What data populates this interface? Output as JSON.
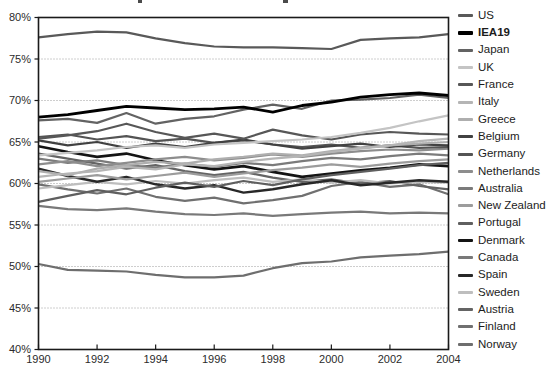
{
  "page": {
    "background": "#ffffff",
    "note": "line chart, y axis 40%-80%, x axis 1990-2004, legend of 20 country series on right, title cropped off at top edge"
  },
  "chart_data": {
    "type": "line",
    "x": [
      1990,
      1991,
      1992,
      1993,
      1994,
      1995,
      1996,
      1997,
      1998,
      1999,
      2000,
      2001,
      2002,
      2003,
      2004
    ],
    "x_tick_labels": [
      "1990",
      "1992",
      "1994",
      "1996",
      "1998",
      "2000",
      "2002",
      "2004"
    ],
    "y_tick_labels": [
      "40%",
      "45%",
      "50%",
      "55%",
      "60%",
      "65%",
      "70%",
      "75%",
      "80%"
    ],
    "xlim": [
      1990,
      2004
    ],
    "ylim": [
      40,
      80
    ],
    "grid": "horizontal dotted lines at 5% steps",
    "legend_position": "right",
    "axis_color": "#1a1a1a",
    "grid_color": "#9c9c9c",
    "tick_label_color": "#2b2b2b",
    "series": [
      {
        "name": "US",
        "color": "#595959",
        "width": 2.2,
        "legend_bold": false,
        "values": [
          77.6,
          78.0,
          78.3,
          78.2,
          77.5,
          76.9,
          76.5,
          76.4,
          76.4,
          76.3,
          76.2,
          77.3,
          77.5,
          77.6,
          78.0
        ]
      },
      {
        "name": "IEA19",
        "color": "#000000",
        "width": 2.8,
        "legend_bold": true,
        "values": [
          68.0,
          68.3,
          68.8,
          69.3,
          69.1,
          68.9,
          69.0,
          69.2,
          68.6,
          69.4,
          69.8,
          70.4,
          70.7,
          70.9,
          70.6
        ]
      },
      {
        "name": "Japan",
        "color": "#636363",
        "width": 2.2,
        "legend_bold": false,
        "values": [
          67.6,
          67.8,
          67.3,
          68.5,
          67.2,
          67.8,
          68.1,
          68.9,
          69.5,
          69.0,
          70.0,
          70.1,
          70.3,
          70.7,
          70.3
        ]
      },
      {
        "name": "UK",
        "color": "#c4c4c4",
        "width": 2.2,
        "legend_bold": false,
        "values": [
          63.4,
          63.7,
          64.0,
          64.4,
          64.6,
          64.3,
          64.7,
          64.9,
          65.1,
          65.3,
          65.6,
          66.1,
          66.7,
          67.5,
          68.2
        ]
      },
      {
        "name": "France",
        "color": "#575757",
        "width": 2.2,
        "legend_bold": false,
        "values": [
          65.4,
          65.8,
          66.3,
          67.2,
          66.2,
          65.5,
          66.0,
          65.4,
          66.5,
          65.8,
          65.3,
          65.9,
          66.2,
          66.0,
          65.9
        ]
      },
      {
        "name": "Italy",
        "color": "#b5b5b5",
        "width": 2.2,
        "legend_bold": false,
        "values": [
          60.8,
          61.2,
          61.5,
          62.0,
          61.7,
          62.3,
          62.1,
          62.6,
          63.0,
          63.3,
          63.8,
          64.2,
          64.6,
          65.1,
          65.4
        ]
      },
      {
        "name": "Greece",
        "color": "#aeaeae",
        "width": 2.2,
        "legend_bold": false,
        "values": [
          61.5,
          61.0,
          61.8,
          62.2,
          62.6,
          62.4,
          62.9,
          63.2,
          63.6,
          63.4,
          63.9,
          64.3,
          64.6,
          64.8,
          65.0
        ]
      },
      {
        "name": "Belgium",
        "color": "#414141",
        "width": 2.2,
        "legend_bold": false,
        "values": [
          65.2,
          64.6,
          65.0,
          64.3,
          64.8,
          64.4,
          64.9,
          65.3,
          64.7,
          64.2,
          64.5,
          64.8,
          64.4,
          64.7,
          64.6
        ]
      },
      {
        "name": "Germany",
        "color": "#545454",
        "width": 2.2,
        "legend_bold": false,
        "values": [
          65.6,
          65.9,
          65.3,
          65.7,
          65.1,
          65.4,
          64.9,
          65.2,
          64.7,
          64.4,
          64.7,
          64.3,
          64.6,
          64.3,
          64.4
        ]
      },
      {
        "name": "Netherlands",
        "color": "#8d8d8d",
        "width": 2.2,
        "legend_bold": false,
        "values": [
          62.3,
          62.7,
          62.1,
          62.5,
          62.9,
          63.2,
          62.8,
          63.1,
          63.5,
          63.2,
          63.6,
          63.9,
          64.1,
          64.0,
          64.2
        ]
      },
      {
        "name": "Australia",
        "color": "#7b7b7b",
        "width": 2.2,
        "legend_bold": false,
        "values": [
          63.0,
          62.5,
          62.8,
          62.2,
          61.9,
          62.4,
          62.0,
          62.5,
          62.2,
          62.7,
          63.1,
          62.9,
          63.3,
          63.6,
          63.4
        ]
      },
      {
        "name": "New Zealand",
        "color": "#9c9c9c",
        "width": 2.2,
        "legend_bold": false,
        "values": [
          60.2,
          60.6,
          61.0,
          60.5,
          60.9,
          61.3,
          60.8,
          61.2,
          61.6,
          61.9,
          62.3,
          62.0,
          62.4,
          62.7,
          62.9
        ]
      },
      {
        "name": "Portugal",
        "color": "#5f5f5f",
        "width": 2.2,
        "legend_bold": false,
        "values": [
          57.8,
          58.5,
          59.2,
          58.7,
          59.5,
          60.1,
          59.6,
          60.3,
          59.8,
          60.5,
          61.0,
          61.4,
          61.8,
          62.2,
          62.5
        ]
      },
      {
        "name": "Denmark",
        "color": "#141414",
        "width": 2.6,
        "legend_bold": false,
        "values": [
          64.5,
          63.8,
          63.2,
          63.6,
          62.8,
          62.2,
          61.7,
          62.1,
          61.4,
          60.8,
          61.2,
          61.6,
          61.9,
          62.3,
          62.1
        ]
      },
      {
        "name": "Canada",
        "color": "#797979",
        "width": 2.2,
        "legend_bold": false,
        "values": [
          57.3,
          56.9,
          56.8,
          57.0,
          56.6,
          56.3,
          56.2,
          56.4,
          56.1,
          56.3,
          56.5,
          56.6,
          56.4,
          56.5,
          56.4
        ]
      },
      {
        "name": "Spain",
        "color": "#282828",
        "width": 2.4,
        "legend_bold": false,
        "values": [
          61.8,
          60.9,
          60.2,
          60.8,
          59.9,
          59.4,
          59.8,
          58.9,
          59.3,
          59.9,
          60.4,
          59.8,
          60.1,
          60.4,
          60.2
        ]
      },
      {
        "name": "Sweden",
        "color": "#bebebe",
        "width": 2.2,
        "legend_bold": false,
        "values": [
          59.4,
          59.8,
          60.2,
          59.9,
          60.3,
          60.0,
          60.4,
          60.7,
          60.2,
          60.5,
          60.1,
          60.4,
          60.0,
          60.2,
          60.1
        ]
      },
      {
        "name": "Austria",
        "color": "#646464",
        "width": 2.2,
        "legend_bold": false,
        "values": [
          63.6,
          63.0,
          62.4,
          61.8,
          62.2,
          61.5,
          61.0,
          61.4,
          60.7,
          60.2,
          60.5,
          60.0,
          60.3,
          59.7,
          59.3
        ]
      },
      {
        "name": "Finland",
        "color": "#707070",
        "width": 2.2,
        "legend_bold": false,
        "values": [
          59.9,
          59.3,
          58.8,
          59.4,
          58.4,
          57.9,
          58.3,
          57.6,
          58.0,
          58.5,
          59.7,
          60.2,
          59.6,
          59.9,
          58.7
        ]
      },
      {
        "name": "Norway",
        "color": "#6e6e6e",
        "width": 2.2,
        "legend_bold": false,
        "values": [
          50.3,
          49.6,
          49.5,
          49.4,
          49.0,
          48.7,
          48.7,
          48.9,
          49.8,
          50.4,
          50.6,
          51.1,
          51.3,
          51.5,
          51.8
        ]
      }
    ]
  }
}
